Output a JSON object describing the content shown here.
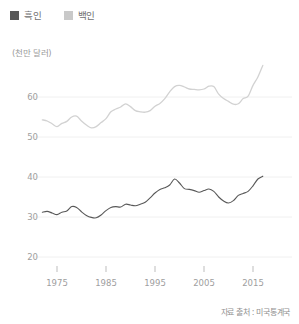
{
  "legend": {
    "items": [
      {
        "label": "흑인",
        "color": "#595959",
        "icon": "square-swatch"
      },
      {
        "label": "백인",
        "color": "#c9c9c9",
        "icon": "square-swatch"
      }
    ]
  },
  "axis": {
    "unit_label": "(천만 달러)",
    "y_ticks": [
      "60",
      "50",
      "40",
      "30",
      "20"
    ],
    "x_ticks": [
      "1975",
      "1985",
      "1995",
      "2005",
      "2015"
    ]
  },
  "source": {
    "text": "자료 출처 : 미국통계국"
  },
  "colors": {
    "black_series": "#595959",
    "white_series": "#d2d2d2",
    "gridline": "#f0f0f0",
    "tick_mark": "#bdbdbd",
    "text": "#9e9e9e"
  },
  "chart_data": {
    "type": "line",
    "title": "",
    "subtitle": "",
    "xlabel": "",
    "ylabel": "(천만 달러)",
    "xlim": [
      1972,
      2017
    ],
    "ylim": [
      20,
      70
    ],
    "grid": true,
    "gridlines_y": [
      20,
      30,
      40,
      50,
      60
    ],
    "legend_position": "top-left",
    "x": [
      1972,
      1973,
      1974,
      1975,
      1976,
      1977,
      1978,
      1979,
      1980,
      1981,
      1982,
      1983,
      1984,
      1985,
      1986,
      1987,
      1988,
      1989,
      1990,
      1991,
      1992,
      1993,
      1994,
      1995,
      1996,
      1997,
      1998,
      1999,
      2000,
      2001,
      2002,
      2003,
      2004,
      2005,
      2006,
      2007,
      2008,
      2009,
      2010,
      2011,
      2012,
      2013,
      2014,
      2015,
      2016,
      2017
    ],
    "series": [
      {
        "name": "백인",
        "color": "#d2d2d2",
        "values": [
          54.3,
          54.0,
          53.3,
          52.6,
          53.4,
          53.9,
          55.0,
          55.2,
          54.0,
          53.0,
          52.3,
          52.6,
          53.6,
          54.6,
          56.3,
          57.0,
          57.5,
          58.3,
          57.6,
          56.6,
          56.3,
          56.2,
          56.6,
          57.7,
          58.4,
          59.6,
          61.3,
          62.6,
          62.9,
          62.5,
          62.0,
          61.9,
          61.8,
          62.0,
          62.7,
          62.6,
          60.7,
          59.6,
          58.9,
          58.2,
          58.3,
          59.6,
          60.2,
          62.9,
          65.0,
          67.9
        ]
      },
      {
        "name": "흑인",
        "color": "#595959",
        "values": [
          31.2,
          31.4,
          31.0,
          30.6,
          31.2,
          31.5,
          32.6,
          32.4,
          31.3,
          30.4,
          29.9,
          29.8,
          30.5,
          31.6,
          32.4,
          32.6,
          32.5,
          33.2,
          33.0,
          32.8,
          33.2,
          33.7,
          34.8,
          36.0,
          36.9,
          37.3,
          38.0,
          39.5,
          38.5,
          37.1,
          36.9,
          36.6,
          36.2,
          36.6,
          37.0,
          36.4,
          35.0,
          34.0,
          33.5,
          34.1,
          35.4,
          35.9,
          36.4,
          37.8,
          39.5,
          40.2
        ]
      }
    ]
  }
}
